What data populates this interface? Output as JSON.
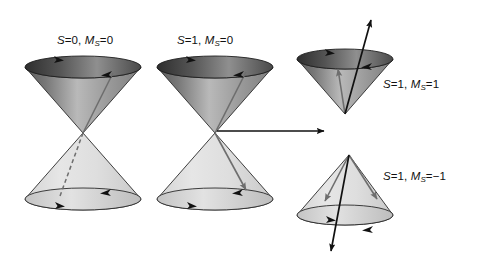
{
  "figure": {
    "background": "#ffffff",
    "width": 480,
    "height": 267
  },
  "labels": {
    "singlet": {
      "symbol": "S",
      "s_value": "=0,",
      "m_symbol": "M",
      "m_sub": "S",
      "m_value": "=0"
    },
    "triplet_m0": {
      "symbol": "S",
      "s_value": "=1,",
      "m_symbol": "M",
      "m_sub": "S",
      "m_value": "=0"
    },
    "triplet_mp1": {
      "symbol": "S",
      "s_value": "=1,",
      "m_symbol": "M",
      "m_sub": "S",
      "m_value": "=1"
    },
    "triplet_mm1": {
      "symbol": "S",
      "s_value": "=1,",
      "m_symbol": "M",
      "m_sub": "S",
      "m_value": "=−1"
    }
  },
  "colors": {
    "background": "#ffffff",
    "outline": "#1a1a1a",
    "cone_dark": "#4a4a4a",
    "cone_mid": "#9a9a9a",
    "cone_light": "#d8d8d8",
    "cone_pale": "#e8e8e8",
    "rim_dark": "#3c3c3c",
    "vector_black": "#111111",
    "vector_gray": "#6e6e6e",
    "text": "#111111"
  },
  "diagrams": [
    {
      "name": "singlet-double-cone",
      "label_key": "singlet",
      "cone_count": 2,
      "upper_cone": {
        "orientation": "inverted",
        "rim_cx": 83,
        "rim_cy": 67,
        "rim_rx": 58,
        "rim_ry": 11,
        "apex_x": 83,
        "apex_y": 133,
        "shading": "dark"
      },
      "lower_cone": {
        "orientation": "upright",
        "rim_cx": 83,
        "rim_cy": 199,
        "rim_rx": 58,
        "rim_ry": 11,
        "apex_x": 83,
        "apex_y": 133,
        "shading": "pale"
      },
      "vectors": [
        {
          "style": "solid",
          "color": "vector_gray",
          "from": [
            83,
            133
          ],
          "to": [
            113,
            73
          ],
          "arrowhead": false
        },
        {
          "style": "dashed",
          "color": "vector_gray",
          "from": [
            83,
            133
          ],
          "to": [
            60,
            196
          ],
          "arrowhead": false
        }
      ],
      "rim_arrows": [
        {
          "on": "upper",
          "x": 60,
          "y": 59,
          "dir": "right"
        },
        {
          "on": "upper",
          "x": 104,
          "y": 74,
          "dir": "left"
        },
        {
          "on": "lower",
          "x": 61,
          "y": 205,
          "dir": "right"
        },
        {
          "on": "lower",
          "x": 103,
          "y": 192,
          "dir": "left"
        }
      ]
    },
    {
      "name": "triplet-m0-double-cone",
      "label_key": "triplet_m0",
      "cone_count": 2,
      "upper_cone": {
        "orientation": "inverted",
        "rim_cx": 215,
        "rim_cy": 67,
        "rim_rx": 58,
        "rim_ry": 11,
        "apex_x": 215,
        "apex_y": 133,
        "shading": "dark"
      },
      "lower_cone": {
        "orientation": "upright",
        "rim_cx": 215,
        "rim_cy": 199,
        "rim_rx": 58,
        "rim_ry": 11,
        "apex_x": 215,
        "apex_y": 133,
        "shading": "pale"
      },
      "vectors": [
        {
          "style": "solid",
          "color": "vector_gray",
          "from": [
            215,
            133
          ],
          "to": [
            246,
            72
          ],
          "arrowhead": false
        },
        {
          "style": "solid",
          "color": "vector_gray",
          "from": [
            215,
            133
          ],
          "to": [
            248,
            193
          ],
          "arrowhead": true
        }
      ],
      "rim_arrows": [
        {
          "on": "upper",
          "x": 192,
          "y": 59,
          "dir": "right"
        },
        {
          "on": "upper",
          "x": 236,
          "y": 74,
          "dir": "left"
        },
        {
          "on": "lower",
          "x": 193,
          "y": 205,
          "dir": "right"
        },
        {
          "on": "lower",
          "x": 235,
          "y": 192,
          "dir": "left"
        }
      ],
      "connector": {
        "name": "split-arrow",
        "from": [
          217,
          131
        ],
        "to": [
          331,
          131
        ],
        "arrowhead": true
      }
    },
    {
      "name": "triplet-mplus1-cone",
      "label_key": "triplet_mp1",
      "cone_count": 1,
      "cone": {
        "orientation": "inverted",
        "rim_cx": 345,
        "rim_cy": 59,
        "rim_rx": 48,
        "rim_ry": 10,
        "apex_x": 345,
        "apex_y": 114,
        "shading": "dark"
      },
      "vectors": [
        {
          "style": "solid",
          "color": "vector_black",
          "from": [
            345,
            114
          ],
          "to": [
            372,
            16
          ],
          "arrowhead": true
        },
        {
          "style": "solid",
          "color": "vector_gray",
          "from": [
            345,
            114
          ],
          "to": [
            338,
            65
          ],
          "arrowhead": true
        }
      ],
      "rim_arrows": [
        {
          "on": "rim",
          "x": 330,
          "y": 52,
          "dir": "right"
        },
        {
          "on": "rim",
          "x": 365,
          "y": 66,
          "dir": "left"
        }
      ]
    },
    {
      "name": "triplet-mminus1-cone",
      "label_key": "triplet_mm1",
      "cone_count": 1,
      "cone": {
        "orientation": "upright",
        "rim_cx": 345,
        "rim_cy": 215,
        "rim_rx": 48,
        "rim_ry": 10,
        "apex_x": 349,
        "apex_y": 155,
        "shading": "pale"
      },
      "vectors": [
        {
          "style": "solid",
          "color": "vector_black",
          "from": [
            349,
            155
          ],
          "to": [
            330,
            255
          ],
          "arrowhead": true
        },
        {
          "style": "solid",
          "color": "vector_gray",
          "from": [
            349,
            155
          ],
          "to": [
            324,
            205
          ],
          "arrowhead": true
        },
        {
          "style": "solid",
          "color": "vector_gray",
          "from": [
            349,
            155
          ],
          "to": [
            378,
            203
          ],
          "arrowhead": true
        }
      ],
      "rim_arrows": [
        {
          "on": "rim",
          "x": 331,
          "y": 219,
          "dir": "right"
        },
        {
          "on": "rim",
          "x": 366,
          "y": 230,
          "dir": "left"
        }
      ]
    }
  ]
}
